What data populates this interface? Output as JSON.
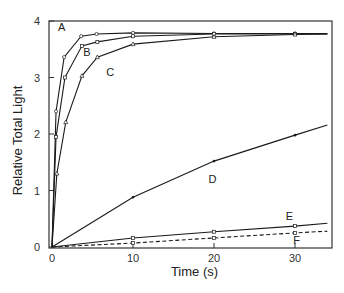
{
  "chart_data": {
    "type": "line",
    "title": "",
    "xlabel": "Time (s)",
    "ylabel": "Relative Total Light",
    "xlim": [
      0,
      34
    ],
    "ylim": [
      0,
      4
    ],
    "xticks": [
      0,
      10,
      20,
      30
    ],
    "yticks": [
      0,
      1,
      2,
      3,
      4
    ],
    "grid": false,
    "legend": "inline labels on curves",
    "series": [
      {
        "name": "A",
        "style": "solid",
        "marker": "circle",
        "x": [
          0,
          0.5,
          1.5,
          3.6,
          5.5,
          10,
          20,
          30,
          34
        ],
        "y": [
          0,
          2.4,
          3.36,
          3.73,
          3.77,
          3.79,
          3.78,
          3.78,
          3.78
        ]
      },
      {
        "name": "B",
        "style": "solid",
        "marker": "square",
        "x": [
          0,
          0.5,
          1.6,
          3.7,
          5.6,
          10,
          20,
          30,
          34
        ],
        "y": [
          0,
          1.95,
          3.0,
          3.56,
          3.63,
          3.73,
          3.77,
          3.77,
          3.77
        ]
      },
      {
        "name": "C",
        "style": "solid",
        "marker": "triangle",
        "x": [
          0,
          0.6,
          1.7,
          3.7,
          5.6,
          10,
          20,
          30,
          34
        ],
        "y": [
          0,
          1.3,
          2.21,
          3.03,
          3.36,
          3.59,
          3.72,
          3.76,
          3.77
        ]
      },
      {
        "name": "D",
        "style": "solid",
        "marker": "dot",
        "x": [
          0,
          10,
          20,
          30,
          34
        ],
        "y": [
          0,
          0.88,
          1.52,
          1.98,
          2.16
        ]
      },
      {
        "name": "E",
        "style": "solid",
        "marker": "square",
        "x": [
          0,
          10,
          20,
          30,
          34
        ],
        "y": [
          0,
          0.16,
          0.27,
          0.37,
          0.42
        ]
      },
      {
        "name": "F",
        "style": "dashed",
        "marker": "square",
        "x": [
          0,
          10,
          20,
          30,
          34
        ],
        "y": [
          0,
          0.07,
          0.16,
          0.25,
          0.28
        ]
      }
    ],
    "annotations": [
      {
        "text": "A",
        "x": 1.2,
        "y": 3.9
      },
      {
        "text": "B",
        "x": 4.3,
        "y": 3.45
      },
      {
        "text": "C",
        "x": 7.2,
        "y": 3.1
      },
      {
        "text": "D",
        "x": 19.8,
        "y": 1.2
      },
      {
        "text": "E",
        "x": 29.3,
        "y": 0.55
      },
      {
        "text": "F",
        "x": 30.2,
        "y": 0.12
      }
    ]
  }
}
